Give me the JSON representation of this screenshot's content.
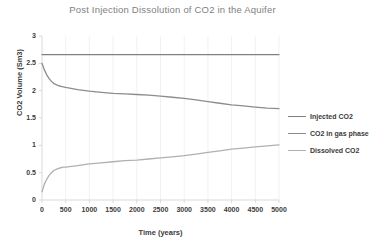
{
  "chart_data": {
    "type": "line",
    "title": "Post Injection Dissolution of CO2 in the Aquifer",
    "xlabel": "Time (years)",
    "ylabel": "CO2 Volume (Sm3)",
    "xlim": [
      0,
      5000
    ],
    "ylim": [
      0,
      3
    ],
    "xticks": [
      0,
      500,
      1000,
      1500,
      2000,
      2500,
      3000,
      3500,
      4000,
      4500,
      5000
    ],
    "xtick_labels": [
      "0",
      "500",
      "1000",
      "1500",
      "2000",
      "2500",
      "3000",
      "3500",
      "4000",
      "4500",
      "5000"
    ],
    "yticks": [
      0,
      0.5,
      1,
      1.5,
      2,
      2.5,
      3
    ],
    "ytick_labels": [
      "0",
      "0.5",
      "1",
      "1.5",
      "2",
      "2.5",
      "3"
    ],
    "grid": true,
    "grid_axis": "x",
    "legend_position": "right",
    "x": [
      0,
      50,
      100,
      150,
      200,
      250,
      300,
      350,
      400,
      450,
      500,
      750,
      1000,
      1250,
      1500,
      1750,
      2000,
      2250,
      2500,
      2750,
      3000,
      3250,
      3500,
      3750,
      4000,
      4250,
      4500,
      4750,
      5000
    ],
    "series": [
      {
        "name": "Injected CO2",
        "color": "#808080",
        "values": [
          2.66,
          2.66,
          2.66,
          2.66,
          2.66,
          2.66,
          2.66,
          2.66,
          2.66,
          2.66,
          2.66,
          2.66,
          2.66,
          2.66,
          2.66,
          2.66,
          2.66,
          2.66,
          2.66,
          2.66,
          2.66,
          2.66,
          2.66,
          2.66,
          2.66,
          2.66,
          2.66,
          2.66,
          2.66
        ]
      },
      {
        "name": "CO2 in gas phase",
        "color": "#8c8c8c",
        "values": [
          2.5,
          2.38,
          2.29,
          2.22,
          2.17,
          2.13,
          2.11,
          2.09,
          2.08,
          2.07,
          2.06,
          2.02,
          1.99,
          1.97,
          1.95,
          1.94,
          1.93,
          1.92,
          1.9,
          1.88,
          1.86,
          1.83,
          1.8,
          1.77,
          1.74,
          1.72,
          1.7,
          1.68,
          1.67
        ]
      },
      {
        "name": "Dissolved CO2",
        "color": "#b0b0b0",
        "values": [
          0.15,
          0.29,
          0.38,
          0.45,
          0.5,
          0.54,
          0.56,
          0.58,
          0.59,
          0.6,
          0.6,
          0.63,
          0.66,
          0.68,
          0.7,
          0.72,
          0.73,
          0.75,
          0.77,
          0.79,
          0.81,
          0.84,
          0.87,
          0.9,
          0.93,
          0.95,
          0.97,
          0.99,
          1.01
        ]
      }
    ]
  },
  "plot_geometry": {
    "left": 42,
    "top": 36,
    "right": 279,
    "bottom": 200
  },
  "axis_color": "#d9d9d9",
  "grid_color": "#ededed"
}
